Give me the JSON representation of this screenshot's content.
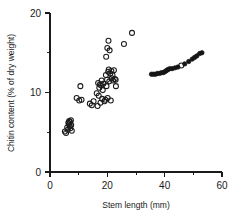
{
  "chart_data": {
    "type": "scatter",
    "title": "",
    "xlabel": "Stem length (mm)",
    "ylabel": "Chitin content (% of dry weight)",
    "xlim": [
      0,
      60
    ],
    "ylim": [
      0,
      20
    ],
    "xticks": [
      0,
      20,
      40,
      60
    ],
    "xticks_minor": [
      10,
      30,
      50
    ],
    "yticks": [
      0,
      10,
      20
    ],
    "yticks_minor": [
      5,
      15
    ],
    "xtick_labels": [
      "0",
      "20",
      "40",
      "60"
    ],
    "ytick_labels": [
      "0",
      "10",
      "20"
    ],
    "grid": false,
    "legend": "none",
    "series": [
      {
        "name": "open-circles",
        "marker": "open-circle",
        "color": "#1a1a1a",
        "points": [
          [
            5.2,
            5.1
          ],
          [
            5.6,
            4.9
          ],
          [
            6.0,
            5.6
          ],
          [
            6.2,
            5.3
          ],
          [
            6.4,
            6.2
          ],
          [
            6.6,
            6.0
          ],
          [
            6.7,
            6.4
          ],
          [
            6.9,
            5.8
          ],
          [
            7.0,
            6.3
          ],
          [
            7.1,
            5.5
          ],
          [
            7.3,
            6.5
          ],
          [
            7.4,
            5.9
          ],
          [
            7.6,
            5.2
          ],
          [
            9.3,
            9.3
          ],
          [
            10.2,
            9.0
          ],
          [
            10.6,
            10.8
          ],
          [
            11.0,
            9.1
          ],
          [
            13.9,
            8.6
          ],
          [
            14.6,
            8.4
          ],
          [
            15.2,
            8.9
          ],
          [
            16.3,
            9.9
          ],
          [
            16.6,
            8.3
          ],
          [
            16.8,
            11.2
          ],
          [
            17.0,
            9.6
          ],
          [
            17.2,
            10.6
          ],
          [
            17.4,
            11.0
          ],
          [
            17.6,
            8.7
          ],
          [
            17.8,
            10.9
          ],
          [
            18.0,
            11.5
          ],
          [
            18.2,
            9.2
          ],
          [
            18.4,
            10.3
          ],
          [
            18.6,
            11.1
          ],
          [
            19.0,
            8.9
          ],
          [
            19.3,
            9.1
          ],
          [
            19.5,
            12.2
          ],
          [
            19.7,
            10.8
          ],
          [
            19.9,
            11.6
          ],
          [
            20.1,
            9.3
          ],
          [
            20.3,
            12.6
          ],
          [
            20.5,
            12.9
          ],
          [
            20.7,
            11.4
          ],
          [
            21.0,
            12.4
          ],
          [
            21.2,
            9.0
          ],
          [
            21.4,
            12.7
          ],
          [
            21.6,
            11.8
          ],
          [
            21.8,
            12.2
          ],
          [
            22.0,
            11.5
          ],
          [
            22.3,
            12.8
          ],
          [
            22.6,
            11.7
          ],
          [
            22.9,
            11.6
          ],
          [
            19.6,
            14.5
          ],
          [
            20.0,
            15.6
          ],
          [
            20.4,
            16.5
          ],
          [
            20.8,
            15.3
          ],
          [
            23.0,
            10.8
          ],
          [
            25.8,
            16.1
          ],
          [
            28.6,
            17.5
          ],
          [
            45.8,
            13.4
          ]
        ]
      },
      {
        "name": "filled-circles",
        "marker": "filled-circle",
        "color": "#151515",
        "points": [
          [
            35.4,
            12.3
          ],
          [
            36.1,
            12.3
          ],
          [
            36.8,
            12.3
          ],
          [
            37.5,
            12.4
          ],
          [
            38.2,
            12.4
          ],
          [
            38.9,
            12.5
          ],
          [
            39.5,
            12.5
          ],
          [
            40.0,
            12.6
          ],
          [
            40.4,
            12.7
          ],
          [
            40.8,
            12.8
          ],
          [
            41.2,
            12.9
          ],
          [
            41.8,
            13.0
          ],
          [
            42.6,
            13.0
          ],
          [
            43.6,
            13.1
          ],
          [
            44.6,
            13.2
          ],
          [
            47.0,
            13.6
          ],
          [
            48.4,
            13.9
          ],
          [
            49.6,
            14.2
          ],
          [
            50.4,
            14.4
          ],
          [
            51.2,
            14.6
          ],
          [
            52.2,
            14.9
          ],
          [
            53.0,
            15.0
          ]
        ]
      }
    ]
  }
}
